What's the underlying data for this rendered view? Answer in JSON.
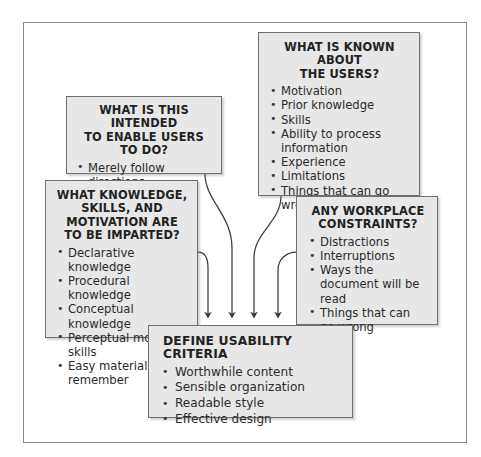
{
  "diagram": {
    "type": "flowchart-convergent",
    "frame": {
      "border_color": "#8a8a8a"
    },
    "node_fill": "#e7e7e7",
    "node_border": "#6f6f6f",
    "arrow_color": "#3a3a3a",
    "nodes": [
      {
        "id": "intended",
        "title": "WHAT IS THIS INTENDED TO ENABLE USERS TO DO?",
        "title_lines": [
          "WHAT IS THIS INTENDED",
          "TO ENABLE USERS TO DO?"
        ],
        "items": [
          "Merely follow directions",
          "Make judgments",
          "Make decisions"
        ]
      },
      {
        "id": "users",
        "title": "WHAT IS KNOWN ABOUT THE USERS?",
        "title_lines": [
          "WHAT IS KNOWN ABOUT",
          "THE USERS?"
        ],
        "items": [
          "Motivation",
          "Prior knowledge",
          "Skills",
          "Ability to process information",
          "Experience",
          "Limitations",
          "Things that can go wrong"
        ]
      },
      {
        "id": "knowledge",
        "title": "WHAT KNOWLEDGE, SKILLS, AND MOTIVATION ARE TO BE IMPARTED?",
        "title_lines": [
          "WHAT KNOWLEDGE,",
          "SKILLS, AND",
          "MOTIVATION ARE",
          "TO BE IMPARTED?"
        ],
        "items": [
          "Declarative knowledge",
          "Procedural knowledge",
          "Conceptual knowledge",
          "Perceptual motor skills",
          "Easy material to remember"
        ]
      },
      {
        "id": "workplace",
        "title": "ANY WORKPLACE CONSTRAINTS?",
        "title_lines": [
          "ANY WORKPLACE",
          "CONSTRAINTS?"
        ],
        "items": [
          "Distractions",
          "Interruptions",
          "Ways the document will be read",
          "Things that can go wrong"
        ]
      },
      {
        "id": "define",
        "title": "DEFINE USABILITY CRITERIA",
        "title_lines": [
          "DEFINE USABILITY CRITERIA"
        ],
        "items": [
          "Worthwhile content",
          "Sensible organization",
          "Readable style",
          "Effective design"
        ]
      }
    ],
    "edges": [
      {
        "from": "knowledge",
        "to": "define"
      },
      {
        "from": "intended",
        "to": "define"
      },
      {
        "from": "users",
        "to": "define"
      },
      {
        "from": "workplace",
        "to": "define"
      }
    ]
  }
}
